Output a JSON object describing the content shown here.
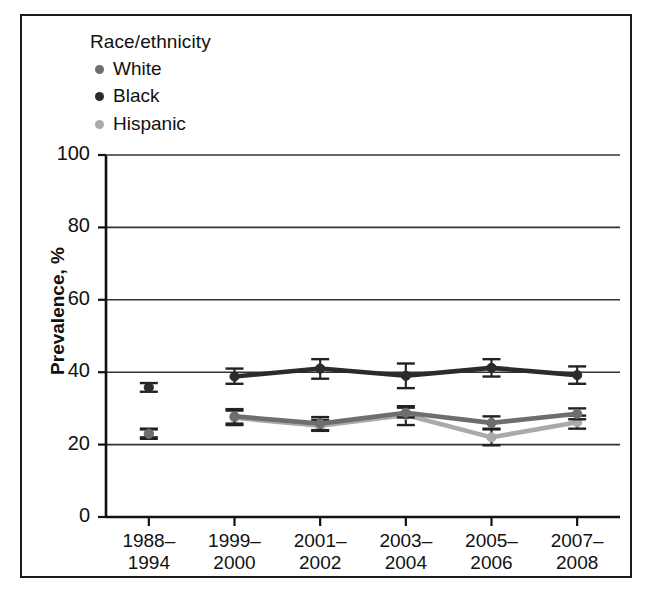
{
  "legend": {
    "title": "Race/ethnicity",
    "position": "top-left",
    "items": [
      {
        "label": "White",
        "color": "#6e6e6e"
      },
      {
        "label": "Black",
        "color": "#2b2b2b"
      },
      {
        "label": "Hispanic",
        "color": "#aaaaaa"
      }
    ]
  },
  "axes": {
    "ylabel": "Prevalence, %",
    "xlabel": "",
    "yticks": [
      "0",
      "20",
      "40",
      "60",
      "80",
      "100"
    ],
    "xticks": [
      {
        "line1": "1988–",
        "line2": "1994"
      },
      {
        "line1": "1999–",
        "line2": "2000"
      },
      {
        "line1": "2001–",
        "line2": "2002"
      },
      {
        "line1": "2003–",
        "line2": "2004"
      },
      {
        "line1": "2005–",
        "line2": "2006"
      },
      {
        "line1": "2007–",
        "line2": "2008"
      }
    ]
  },
  "chart_data": {
    "type": "line",
    "title": "",
    "subtitle": "",
    "xlabel": "",
    "ylabel": "Prevalence, %",
    "ylim": [
      0,
      100
    ],
    "ytick_step": 20,
    "grid": true,
    "grid_values": [
      20,
      40,
      60,
      80
    ],
    "legend_position": "top-left",
    "legend_title": "Race/ethnicity",
    "error_bars": "95% CI",
    "note": "First period (1988-1994) plotted as isolated points; line segments connect 1999-2000 onward.",
    "categories": [
      "1988-1994",
      "1999-2000",
      "2001-2002",
      "2003-2004",
      "2005-2006",
      "2007-2008"
    ],
    "series": [
      {
        "name": "White",
        "color": "#6e6e6e",
        "values": [
          23.0,
          27.8,
          25.8,
          28.8,
          26.0,
          28.5
        ],
        "err_low": [
          22.0,
          25.8,
          24.0,
          27.5,
          24.2,
          27.0
        ],
        "err_high": [
          24.2,
          29.8,
          27.6,
          30.2,
          27.8,
          30.0
        ]
      },
      {
        "name": "Black",
        "color": "#2b2b2b",
        "values": [
          35.8,
          38.8,
          41.0,
          39.0,
          41.2,
          39.2
        ],
        "err_low": [
          34.6,
          36.8,
          38.2,
          35.6,
          38.8,
          36.8
        ],
        "err_high": [
          37.0,
          41.0,
          43.6,
          42.4,
          43.6,
          41.6
        ]
      },
      {
        "name": "Hispanic",
        "color": "#aaaaaa",
        "values": [
          23.0,
          27.4,
          25.2,
          28.2,
          22.0,
          26.2
        ],
        "err_low": [
          21.6,
          25.4,
          23.8,
          25.4,
          19.8,
          24.4
        ],
        "err_high": [
          24.4,
          29.4,
          26.8,
          30.6,
          24.4,
          28.0
        ]
      }
    ]
  }
}
